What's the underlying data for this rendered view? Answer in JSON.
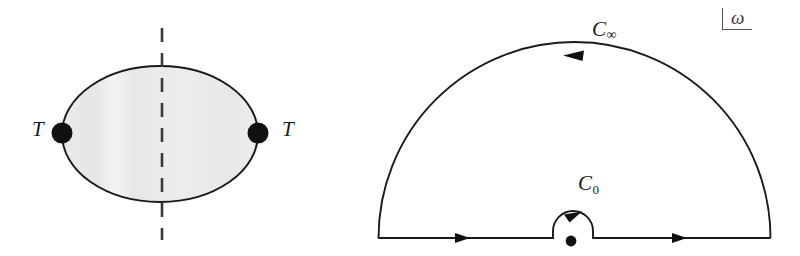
{
  "figure": {
    "background_color": "#ffffff",
    "line_color": "#1a1a1a",
    "blob_fill_color": "#e9e9e9"
  },
  "left_panel": {
    "name": "bubble-diagram-with-cut",
    "blob": {
      "shape": "ellipse",
      "center_x": 160,
      "center_y": 134,
      "radius_x": 98,
      "radius_y": 68,
      "fill": "#e9e9e9",
      "stroke": "#1a1a1a"
    },
    "cut_line": {
      "style": "dashed",
      "orientation": "vertical",
      "x": 162,
      "y_top": 28,
      "y_bottom": 240
    },
    "vertices": [
      {
        "label": "T",
        "dot_x": 62,
        "dot_y": 133,
        "label_x": 32,
        "label_y": 120,
        "side": "left"
      },
      {
        "label": "T",
        "dot_x": 258,
        "dot_y": 133,
        "label_x": 282,
        "label_y": 120,
        "side": "right"
      }
    ]
  },
  "right_panel": {
    "name": "complex-frequency-contour",
    "axis_marker": {
      "variable": "ω",
      "corner_x": 722,
      "corner_y": 8
    },
    "big_arc": {
      "label": "C",
      "sublabel": "∞",
      "label_x": 592,
      "label_y": 18,
      "center_x": 574.5,
      "center_y": 238,
      "radius": 196,
      "arrow_direction": "counterclockwise-leftward-at-apex"
    },
    "small_arc": {
      "label": "C",
      "sublabel": "0",
      "label_x": 578,
      "label_y": 172,
      "center_x": 573,
      "center_y": 238,
      "radius": 20,
      "arrow_direction": "clockwise-rightward-at-apex"
    },
    "real_axis": {
      "y": 238,
      "x_left": 378,
      "x_right": 771,
      "arrows": [
        {
          "x": 468,
          "direction": "right"
        },
        {
          "x": 685,
          "direction": "right"
        }
      ]
    },
    "pole": {
      "name": "pole-marker",
      "x": 571,
      "y": 241,
      "radius": 5
    }
  }
}
